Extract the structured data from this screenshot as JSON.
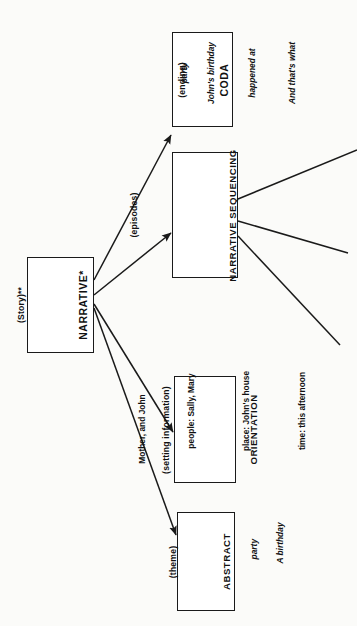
{
  "diagram": {
    "orientation": "rotated-90-ccw",
    "stroke_color": "#1a1a1a",
    "background_color": "#fbfbf9",
    "root": {
      "title": "NARRATIVE*",
      "subtitle": "(Story)**"
    },
    "nodes": [
      {
        "id": "coda",
        "title": "CODA",
        "subtitle": "(ending)",
        "example_lines": [
          "And that's what",
          "happened at",
          "John's birthday",
          "party"
        ]
      },
      {
        "id": "narrative-sequencing",
        "title": "NARRATIVE SEQUENCING",
        "subtitle": "(episodes)",
        "example_lines": []
      },
      {
        "id": "orientation",
        "title": "ORIENTATION",
        "subtitle": "(setting information)",
        "example_lines": [
          "time:  this afternoon",
          "place:  John's house",
          "people:  Sally, Mary",
          "Mother, and John"
        ]
      },
      {
        "id": "abstract",
        "title": "ABSTRACT",
        "subtitle": "(theme)",
        "example_lines": [
          "A birthday",
          "party"
        ]
      }
    ],
    "orientation_detail": {
      "time_label": "time:",
      "time_value": "this afternoon",
      "place_label": "place:",
      "place_value": "John's house",
      "people_label": "people:",
      "people_value": "Sally, Mary",
      "people_value_2": "Mother, and John"
    },
    "edges": [
      {
        "from": "NARRATIVE*",
        "to": "CODA"
      },
      {
        "from": "NARRATIVE*",
        "to": "NARRATIVE SEQUENCING"
      },
      {
        "from": "NARRATIVE*",
        "to": "ORIENTATION"
      },
      {
        "from": "NARRATIVE*",
        "to": "ABSTRACT"
      },
      {
        "from": "NARRATIVE SEQUENCING",
        "to": "episode-branch-1"
      },
      {
        "from": "NARRATIVE SEQUENCING",
        "to": "episode-branch-2"
      },
      {
        "from": "NARRATIVE SEQUENCING",
        "to": "episode-branch-3"
      }
    ]
  }
}
